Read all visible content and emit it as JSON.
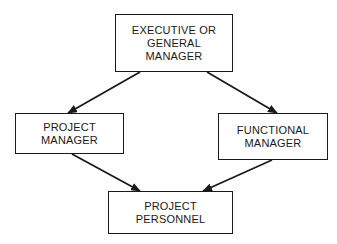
{
  "diagram": {
    "nodes": {
      "executive": {
        "lines": [
          "EXECUTIVE OR",
          "GENERAL",
          "MANAGER"
        ]
      },
      "project_manager": {
        "lines": [
          "PROJECT",
          "MANAGER"
        ]
      },
      "functional_manager": {
        "lines": [
          "FUNCTIONAL",
          "MANAGER"
        ]
      },
      "project_personnel": {
        "lines": [
          "PROJECT",
          "PERSONNEL"
        ]
      }
    },
    "edges": [
      {
        "from": "executive",
        "to": "project_manager"
      },
      {
        "from": "executive",
        "to": "functional_manager"
      },
      {
        "from": "project_manager",
        "to": "project_personnel"
      },
      {
        "from": "functional_manager",
        "to": "project_personnel"
      }
    ],
    "colors": {
      "stroke": "#1a1a1a",
      "background": "#ffffff"
    }
  }
}
